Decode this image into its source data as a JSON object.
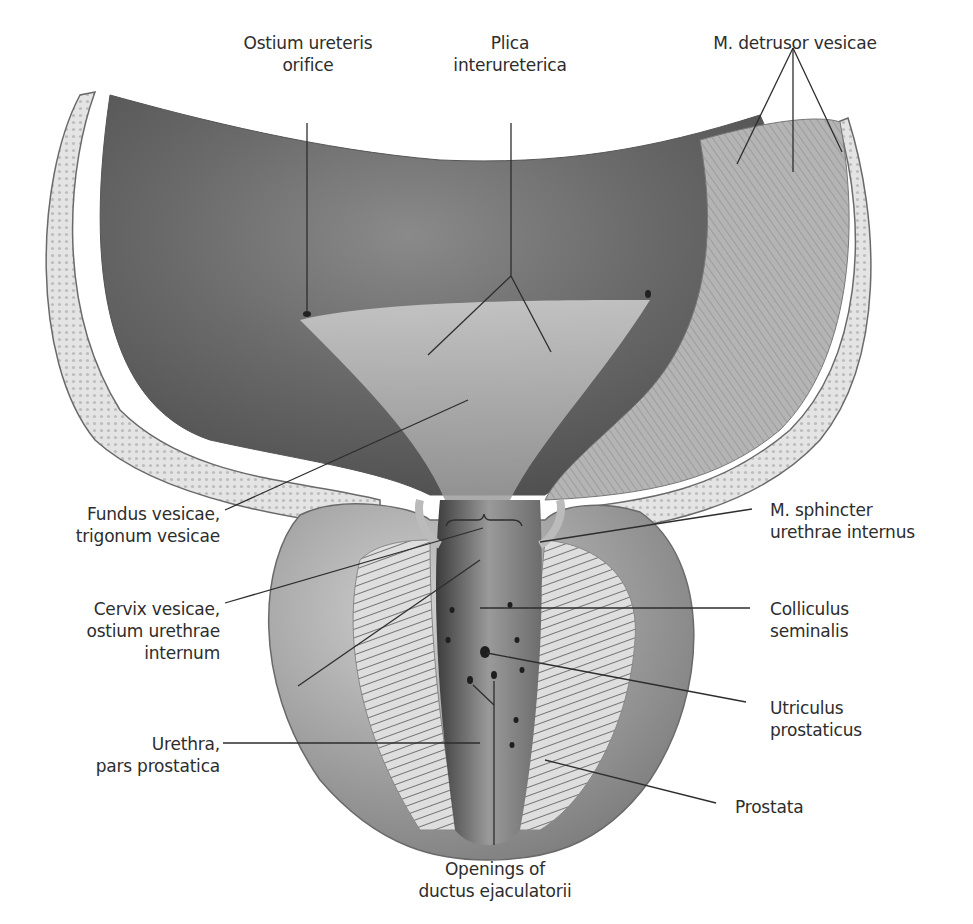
{
  "figure": {
    "colors": {
      "background": "#ffffff",
      "mucosa_dark": "#5a5a5a",
      "mucosa_light": "#bdbdbd",
      "wall": "#d8d8d8",
      "muscle": "#a8a8a8",
      "prostate_outer": "#9a9a9a",
      "label_text": "#2d2d2d",
      "leader_line": "#2d2d2d"
    }
  },
  "labels": {
    "ostium_ureteris": {
      "line1": "Ostium ureteris",
      "line2": "orifice"
    },
    "plica_interureterica": {
      "line1": "Plica",
      "line2": "interureterica"
    },
    "detrusor": {
      "line1": "M. detrusor vesicae"
    },
    "fundus": {
      "line1": "Fundus vesicae,",
      "line2": "trigonum vesicae"
    },
    "cervix": {
      "line1": "Cervix vesicae,",
      "line2": "ostium urethrae",
      "line3": "internum"
    },
    "urethra": {
      "line1": "Urethra,",
      "line2": "pars prostatica"
    },
    "sphincter": {
      "line1": "M. sphincter",
      "line2": "urethrae internus"
    },
    "colliculus": {
      "line1": "Colliculus",
      "line2": "seminalis"
    },
    "utriculus": {
      "line1": "Utriculus",
      "line2": "prostaticus"
    },
    "prostata": {
      "line1": "Prostata"
    },
    "openings": {
      "line1": "Openings of",
      "line2": "ductus ejaculatorii"
    }
  }
}
